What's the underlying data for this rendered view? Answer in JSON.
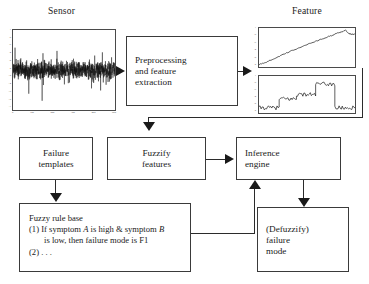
{
  "diagram": {
    "labels": {
      "sensor": "Sensor",
      "feature": "Feature"
    },
    "boxes": {
      "preprocessing": "Preprocessing\nand feature\nextraction",
      "failure_templates": "Failure\ntemplates",
      "fuzzify_features": "Fuzzify\nfeatures",
      "inference_engine": "Inference\nengine",
      "defuzzify": "(Defuzzify)\nfailure\nmode"
    },
    "rule_base": {
      "heading": "Fuzzy rule base",
      "rule1_line1_pre": "(1) If symptom ",
      "rule1_sym_a": "A",
      "rule1_line1_mid": " is high & symptom ",
      "rule1_sym_b": "B",
      "rule1_line2": "is low, then failure mode is F1",
      "rule2": "(2) . . ."
    },
    "arrows": [
      {
        "name": "sensor-to-preprocessing",
        "direction": "right"
      },
      {
        "name": "preprocessing-to-feature",
        "direction": "right"
      },
      {
        "name": "feature-to-fuzzify",
        "direction": "down"
      },
      {
        "name": "fuzzify-to-inference",
        "direction": "right"
      },
      {
        "name": "failure-templates-to-rulebase",
        "direction": "down"
      },
      {
        "name": "rulebase-to-inference",
        "direction": "up"
      },
      {
        "name": "inference-to-defuzzify",
        "direction": "down"
      }
    ]
  },
  "chart_data": [
    {
      "name": "sensor-signal",
      "type": "line",
      "title": "Sensor",
      "xlabel": "",
      "ylabel": "",
      "description": "Dense high-frequency noisy vibration time series centered near zero",
      "xlim": [
        0,
        500
      ],
      "ylim": [
        -1,
        1
      ],
      "xticks": [
        "0",
        "100",
        "200",
        "300",
        "400",
        "500"
      ],
      "yticks": [
        "1",
        "0.8",
        "0.6",
        "0.4",
        "0.2",
        "0",
        "-0.2",
        "-0.4",
        "-0.6",
        "-0.8",
        "-1"
      ]
    },
    {
      "name": "feature-trend",
      "type": "line",
      "title": "Feature",
      "xlabel": "",
      "ylabel": "",
      "description": "Monotonically increasing near-linear ramp with small peak and dip near the right end",
      "xlim": [
        0,
        200
      ],
      "ylim": [
        0,
        1
      ],
      "xticks": [
        "0",
        "50",
        "100",
        "150",
        "200"
      ],
      "yticks": [
        "1",
        "0.8",
        "0.6",
        "0.4",
        "0.2",
        "0"
      ],
      "x": [
        0,
        10,
        25,
        45,
        65,
        85,
        105,
        125,
        145,
        160,
        172,
        180,
        186,
        192,
        200
      ],
      "values": [
        0.06,
        0.1,
        0.18,
        0.29,
        0.4,
        0.5,
        0.6,
        0.69,
        0.78,
        0.85,
        0.9,
        0.95,
        0.86,
        0.84,
        0.84
      ]
    },
    {
      "name": "feature-staircase",
      "type": "line",
      "title": "",
      "xlabel": "",
      "ylabel": "",
      "description": "Noisy staircase rising through four levels then dropping back to the lowest level",
      "xlim": [
        0,
        200
      ],
      "ylim": [
        0,
        1
      ],
      "xticks": [
        "0",
        "50",
        "100",
        "150",
        "200"
      ],
      "yticks": [
        "1",
        "0.8",
        "0.6",
        "0.4",
        "0.2",
        "0"
      ],
      "levels": [
        0.14,
        0.38,
        0.5,
        0.78,
        0.14
      ],
      "segment_breaks": [
        0,
        42,
        78,
        118,
        158,
        200
      ]
    }
  ]
}
